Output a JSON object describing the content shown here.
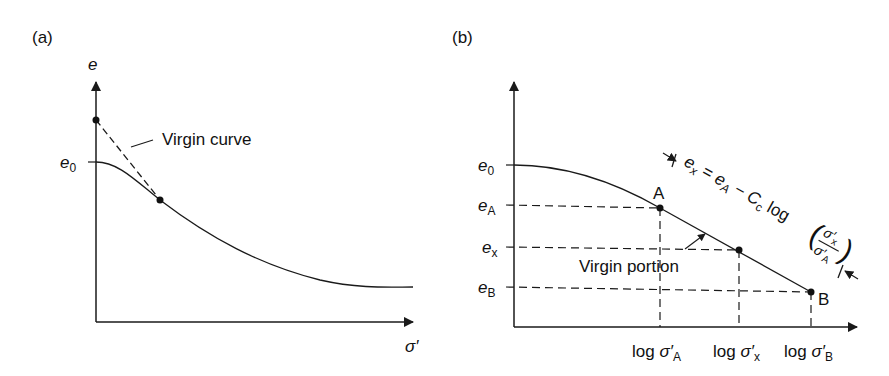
{
  "figure": {
    "line_color": "#1a1a1a"
  },
  "panel_a": {
    "label": "(a)",
    "y_axis_label": "e",
    "x_axis_label": "σ′",
    "e0_label": "e",
    "e0_sub": "0",
    "annotation": "Virgin curve"
  },
  "panel_b": {
    "label": "(b)",
    "y_labels": [
      {
        "main": "e",
        "sub": "0"
      },
      {
        "main": "e",
        "sub": "A"
      },
      {
        "main": "e",
        "sub": "x"
      },
      {
        "main": "e",
        "sub": "B"
      }
    ],
    "x_labels": [
      {
        "prefix": "log ",
        "main": "σ′",
        "sub": "A"
      },
      {
        "prefix": "log ",
        "main": "σ′",
        "sub": "x"
      },
      {
        "prefix": "log ",
        "main": "σ′",
        "sub": "B"
      }
    ],
    "point_A": "A",
    "point_B": "B",
    "annotation": "Virgin portion",
    "equation": {
      "lhs_main": "e",
      "lhs_sub": "x",
      "eq": " = ",
      "ea_main": "e",
      "ea_sub": "A",
      "minus": " − ",
      "cc_main": "C",
      "cc_sub": "c",
      "log": " log",
      "num_main": "σ′",
      "num_sub": "x",
      "den_main": "σ′",
      "den_sub": "A"
    }
  }
}
